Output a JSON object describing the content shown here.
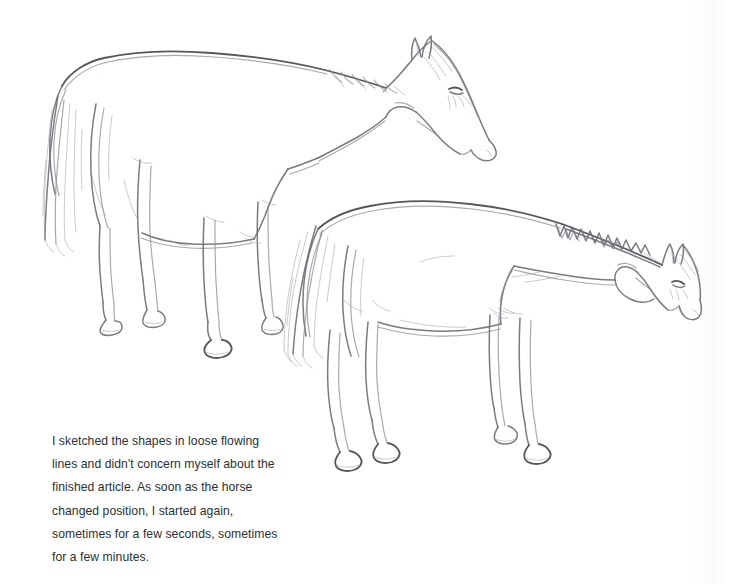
{
  "page": {
    "kind": "book-page-scan",
    "background_color": "#ffffff",
    "width": 735,
    "height": 584
  },
  "caption": {
    "name": "sketch-caption",
    "text": "I sketched the shapes in loose flowing\nlines and didn't concern myself about the\nfinished article. As soon as the horse\nchanged position, I started again,\nsometimes for a few seconds, sometimes\nfor a few minutes.",
    "lines": [
      "I sketched the shapes in loose flowing",
      "lines and didn't concern myself about the",
      "finished article. As soon as the horse",
      "changed position, I started again,",
      "sometimes for a few seconds, sometimes",
      "for a few minutes."
    ],
    "text_color": "#2c2f34"
  },
  "artwork": {
    "title": "Two pencil sketches of standing horses",
    "medium": "graphite pencil line drawing",
    "stroke_colors": {
      "primary": "#6e7076",
      "soft": "#8a8d94",
      "faint": "#a3a6ad",
      "dark": "#4c4e55"
    },
    "subjects": [
      {
        "name": "horse-upper-left",
        "description": "Standing horse in three-quarter rear view, head lowered and turned to the right",
        "facing": "right",
        "head_position": "lowered",
        "features": [
          "tail",
          "mane",
          "four-legs",
          "hooves",
          "eye",
          "ears",
          "muzzle"
        ]
      },
      {
        "name": "horse-lower-right",
        "description": "Standing horse in side view facing right with a spiky zigzag mane along the crest",
        "facing": "right",
        "head_position": "level-lowered",
        "features": [
          "zigzag-mane",
          "tail",
          "four-legs",
          "hooves",
          "eye",
          "ears",
          "muzzle"
        ]
      }
    ]
  }
}
